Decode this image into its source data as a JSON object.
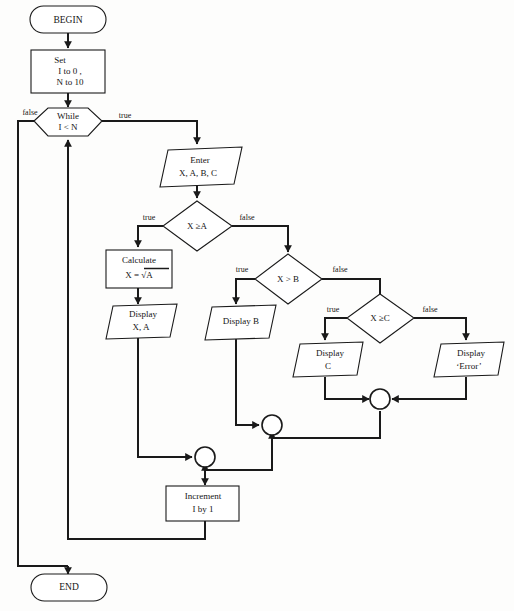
{
  "diagram": {
    "type": "flowchart",
    "background_color": "#fdfdfc",
    "line_color": "#1a1a1a",
    "nodes": [
      {
        "id": "begin",
        "shape": "terminator",
        "text": "BEGIN"
      },
      {
        "id": "set",
        "shape": "process",
        "line1": "Set",
        "line2": "I to 0 ,",
        "line3": "N to 10"
      },
      {
        "id": "while",
        "shape": "hexagon",
        "line1": "While",
        "line2": "I < N"
      },
      {
        "id": "enter",
        "shape": "parallelogram",
        "line1": "Enter",
        "line2": "X, A, B, C"
      },
      {
        "id": "dec_a",
        "shape": "diamond",
        "text": "X ≥A"
      },
      {
        "id": "calculate",
        "shape": "process",
        "line1": "Calculate",
        "line2": "X  =  √A"
      },
      {
        "id": "display_xa",
        "shape": "parallelogram",
        "line1": "Display",
        "line2": "X,  A"
      },
      {
        "id": "dec_b",
        "shape": "diamond",
        "text": "X > B"
      },
      {
        "id": "display_b",
        "shape": "parallelogram",
        "text": "Display  B"
      },
      {
        "id": "dec_c",
        "shape": "diamond",
        "text": "X ≥C"
      },
      {
        "id": "display_c",
        "shape": "parallelogram",
        "line1": "Display",
        "line2": "C"
      },
      {
        "id": "display_err",
        "shape": "parallelogram",
        "line1": "Display",
        "line2": "‘Error’"
      },
      {
        "id": "increment",
        "shape": "process",
        "line1": "Increment",
        "line2": "I by  1"
      },
      {
        "id": "end",
        "shape": "terminator",
        "text": "END"
      },
      {
        "id": "merge1",
        "shape": "connector",
        "text": ""
      },
      {
        "id": "merge2",
        "shape": "connector",
        "text": ""
      },
      {
        "id": "merge3",
        "shape": "connector",
        "text": ""
      }
    ],
    "edge_labels": {
      "while_false": "false",
      "while_true": "true",
      "dec_a_true": "true",
      "dec_a_false": "false",
      "dec_b_true": "true",
      "dec_b_false": "false",
      "dec_c_true": "true",
      "dec_c_false": "false"
    }
  }
}
